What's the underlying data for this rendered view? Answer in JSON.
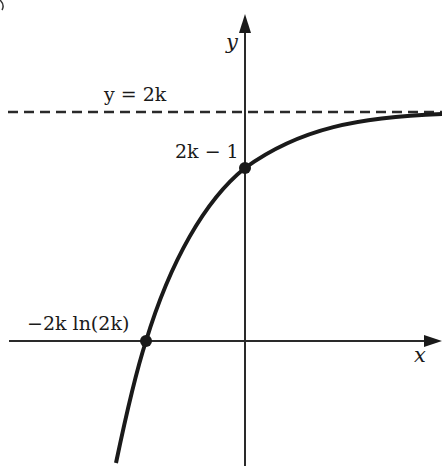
{
  "diagram": {
    "type": "function-graph",
    "curve": "y = 2k - e^(-x/(2k))-type exponential approaching horizontal asymptote",
    "axes": {
      "x_label": "x",
      "y_label": "y"
    },
    "asymptote": {
      "label": "y = 2k",
      "style": "dashed"
    },
    "points": [
      {
        "label": "2k − 1",
        "role": "y-intercept"
      },
      {
        "label": "−2k ln(2k)",
        "role": "x-intercept"
      }
    ]
  },
  "labels": {
    "y_axis": "y",
    "x_axis": "x",
    "asymptote": "y = 2k",
    "y_intercept": "2k − 1",
    "x_intercept": "−2k ln(2k)"
  }
}
